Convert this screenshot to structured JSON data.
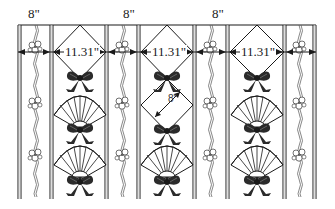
{
  "diagram": {
    "title": "",
    "colors": {
      "ink": "#1a1a1a",
      "background": "#ffffff",
      "bow": "#2b2b2b"
    },
    "narrow_stripe_label": "8\"",
    "wide_panel_label": "11.31\"",
    "diamond_side_label": "8\"",
    "top_labels": [
      {
        "text": "8\"",
        "x": 28,
        "y": 8
      },
      {
        "text": "8\"",
        "x": 123,
        "y": 8
      },
      {
        "text": "8\"",
        "x": 212,
        "y": 8
      }
    ],
    "dimension_labels": [
      {
        "text": "11.31\"",
        "x": 64,
        "y": 46
      },
      {
        "text": "11.31\"",
        "x": 152,
        "y": 46
      },
      {
        "text": "11.31\"",
        "x": 242,
        "y": 46
      }
    ],
    "diagonal_label": {
      "text": "8\"",
      "x": 168,
      "y": 95
    },
    "narrow_stripes": [
      {
        "x1": 18,
        "x2": 53
      },
      {
        "x1": 108,
        "x2": 140
      },
      {
        "x1": 195,
        "x2": 229
      },
      {
        "x1": 285,
        "x2": 316
      }
    ],
    "wide_panels": [
      {
        "x1": 53,
        "x2": 108,
        "pattern": [
          "diamond",
          "fan",
          "fan"
        ]
      },
      {
        "x1": 140,
        "x2": 195,
        "pattern": [
          "diamond",
          "diamond",
          "fan"
        ]
      },
      {
        "x1": 229,
        "x2": 285,
        "pattern": [
          "diamond",
          "fan",
          "fan"
        ]
      }
    ],
    "motifs": [
      "bow",
      "fan",
      "flower-vine",
      "diamond"
    ]
  }
}
